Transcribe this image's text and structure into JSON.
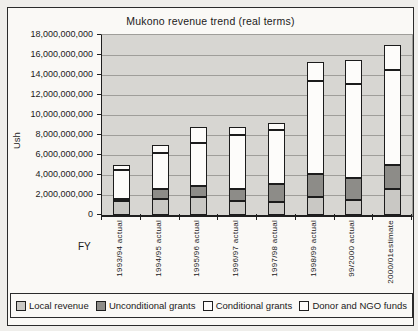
{
  "title": "Mukono revenue trend (real terms)",
  "y_axis": {
    "label": "Ush",
    "ticks": [
      "18,000,000,000",
      "16,000,000,000",
      "14,000,000,000",
      "12,000,000,000",
      "10,000,000,000",
      "8,000,000,000",
      "6,000,000,000",
      "4,000,000,000",
      "2,000,000,000",
      "0"
    ]
  },
  "x_axis": {
    "label": "FY"
  },
  "colors": {
    "plot_background": "#d7d6d2",
    "gridline": "#9f9e9a",
    "axis_line": "#1f1f1f",
    "figure_background": "#faf9f6"
  },
  "chart_data": {
    "type": "bar",
    "stacked": true,
    "title": "Mukono revenue trend (real terms)",
    "xlabel": "FY",
    "ylabel": "Ush",
    "ylim": [
      0,
      18000000000
    ],
    "ytick_interval": 2000000000,
    "grid": true,
    "legend_position": "bottom",
    "categories": [
      "1993/94 actual",
      "1994/95 actual",
      "1995/96 actual",
      "1996/97 actual",
      "1997/98 actual",
      "1998/99 actual",
      "99/2000 actual",
      "2000/01estimate"
    ],
    "series": [
      {
        "name": "Local revenue",
        "color": "#c9c8c4",
        "values": [
          1400000000,
          1600000000,
          1800000000,
          1400000000,
          1300000000,
          1800000000,
          1500000000,
          2600000000
        ]
      },
      {
        "name": "Unconditional grants",
        "color": "#8d8c88",
        "values": [
          200000000,
          1000000000,
          1100000000,
          1200000000,
          1800000000,
          2300000000,
          2200000000,
          2400000000
        ]
      },
      {
        "name": "Conditional grants",
        "color": "#fdfcfa",
        "values": [
          2900000000,
          3600000000,
          4300000000,
          5400000000,
          5400000000,
          9300000000,
          9400000000,
          9500000000
        ]
      },
      {
        "name": "Donor and NGO funds",
        "color": "#fdfcfa",
        "values": [
          500000000,
          800000000,
          1600000000,
          800000000,
          700000000,
          1900000000,
          2400000000,
          2500000000
        ]
      }
    ]
  }
}
